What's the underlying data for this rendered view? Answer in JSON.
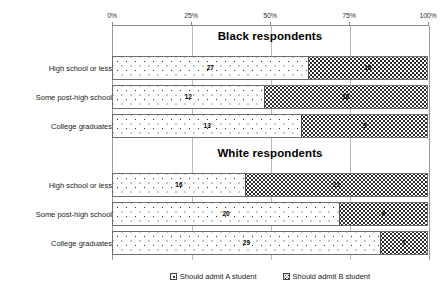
{
  "chart_data": {
    "type": "bar",
    "title": "",
    "xlabel": "",
    "ylabel": "",
    "xlim": [
      0,
      100
    ],
    "grid": true,
    "stacked": true,
    "orientation": "horizontal",
    "legend_position": "bottom",
    "axis_ticks": [
      {
        "value": 0,
        "label": "0%"
      },
      {
        "value": 25,
        "label": "25%"
      },
      {
        "value": 50,
        "label": "50%"
      },
      {
        "value": 75,
        "label": "75%"
      },
      {
        "value": 100,
        "label": "100%"
      }
    ],
    "series": [
      {
        "name": "Should admit A student",
        "pattern": "sparse-dots"
      },
      {
        "name": "Should admit B student",
        "pattern": "dense-dots"
      }
    ],
    "categories": [
      "High school or less",
      "Some post-high school",
      "College graduates"
    ],
    "panels": [
      {
        "title": "Black respondents",
        "rows": [
          {
            "category": "High school or less",
            "a_width": 62,
            "b_width": 38,
            "a_label": "27",
            "b_label": "16"
          },
          {
            "category": "Some post-high school",
            "a_width": 48,
            "b_width": 52,
            "a_label": "12",
            "b_label": "18"
          },
          {
            "category": "College graduates",
            "a_width": 60,
            "b_width": 40,
            "a_label": "13",
            "b_label": "9"
          }
        ]
      },
      {
        "title": "White respondents",
        "rows": [
          {
            "category": "High school or less",
            "a_width": 42,
            "b_width": 58,
            "a_label": "16",
            "b_label": "21"
          },
          {
            "category": "Some post-high school",
            "a_width": 72,
            "b_width": 28,
            "a_label": "20",
            "b_label": "8"
          },
          {
            "category": "College graduates",
            "a_width": 85,
            "b_width": 15,
            "a_label": "29",
            "b_label": "7"
          }
        ]
      }
    ]
  },
  "legend": {
    "items": [
      {
        "label": "Should admit A student"
      },
      {
        "label": "Should admit B student"
      }
    ]
  }
}
